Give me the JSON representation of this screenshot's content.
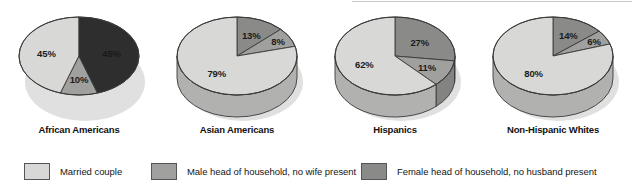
{
  "chart_data": {
    "type": "pie",
    "title": "",
    "subtitle": "",
    "legend_position": "bottom",
    "unit": "percent",
    "categories": [
      "Married couple",
      "Male head of household, no wife present",
      "Female head of household, no husband present"
    ],
    "charts": [
      {
        "label": "African Americans",
        "slices": [
          {
            "category": "Married couple",
            "value": 45,
            "display": "45%"
          },
          {
            "category": "Male head of household, no wife present",
            "value": 10,
            "display": "10%"
          },
          {
            "category": "Female head of household, no husband present",
            "value": 45,
            "display": "45%"
          }
        ]
      },
      {
        "label": "Asian Americans",
        "slices": [
          {
            "category": "Married couple",
            "value": 79,
            "display": "79%"
          },
          {
            "category": "Male head of household, no wife present",
            "value": 8,
            "display": "8%"
          },
          {
            "category": "Female head of household, no husband present",
            "value": 13,
            "display": "13%"
          }
        ]
      },
      {
        "label": "Hispanics",
        "slices": [
          {
            "category": "Married couple",
            "value": 62,
            "display": "62%"
          },
          {
            "category": "Male head of household, no wife present",
            "value": 11,
            "display": "11%"
          },
          {
            "category": "Female head of household, no husband present",
            "value": 27,
            "display": "27%"
          }
        ]
      },
      {
        "label": "Non-Hispanic Whites",
        "slices": [
          {
            "category": "Married couple",
            "value": 80,
            "display": "80%"
          },
          {
            "category": "Male head of household, no wife present",
            "value": 6,
            "display": "6%"
          },
          {
            "category": "Female head of household, no husband present",
            "value": 14,
            "display": "14%"
          }
        ]
      }
    ],
    "colors": {
      "married": "#d8d8d6",
      "male_head": "#a0a09e",
      "female_head": "#8a8a88",
      "female_head_african": "#2e2e2e",
      "outline": "#3a3a3a"
    }
  },
  "legend": {
    "items": [
      {
        "label": "Married couple",
        "color": "#d8d8d6"
      },
      {
        "label": "Male head of household, no wife present",
        "color": "#a0a09e"
      },
      {
        "label": "Female head of household, no husband present",
        "color": "#8a8a88"
      }
    ]
  }
}
